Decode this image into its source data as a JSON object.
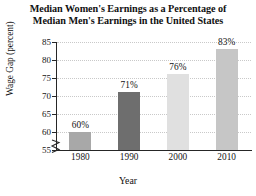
{
  "chart_data": {
    "type": "bar",
    "title": "Median Women's Earnings as a Percentage of Median Men's Earnings in the United States",
    "title_lines": [
      "Median Women's Earnings as a Percentage of",
      "Median Men's Earnings in the United States"
    ],
    "xlabel": "Year",
    "ylabel": "Wage Gap (percent)",
    "categories": [
      "1980",
      "1990",
      "2000",
      "2010"
    ],
    "values": [
      60,
      71,
      76,
      83
    ],
    "point_labels": [
      "60%",
      "71%",
      "76%",
      "83%"
    ],
    "ylim": [
      55,
      85
    ],
    "yticks": [
      55,
      60,
      65,
      70,
      75,
      80,
      85
    ],
    "ytick_labels": [
      "55",
      "60",
      "65",
      "70",
      "75",
      "80",
      "85"
    ],
    "grid": true,
    "grid_style": "dotted-horizontal",
    "legend": "none",
    "y_axis_break": true,
    "bar_colors": [
      "#a8a8a8",
      "#6e6e6e",
      "#e0e0e0",
      "#c6c6c6"
    ],
    "axis_color": "#262626",
    "grid_color": "#c9c9c9",
    "background_color": "#ffffff"
  },
  "icons": {
    "axis_break": "axis-break-zigzag-icon"
  }
}
